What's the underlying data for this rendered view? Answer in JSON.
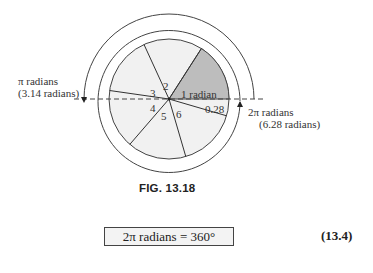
{
  "diagram": {
    "type": "radian-circle",
    "center": [
      169,
      99
    ],
    "radii": {
      "inner": 60,
      "middle": 71,
      "outer": 85
    },
    "colors": {
      "sector_fill": "#f1f1f1",
      "highlight_fill": "#bdbdbd",
      "line": "#444444"
    },
    "segment_labels": [
      "1 radian",
      "2",
      "3",
      "4",
      "5",
      "6",
      "0.28"
    ],
    "left_annotation": {
      "line1": "π radians",
      "line2": "(3.14 radians)"
    },
    "right_annotation": {
      "line1": "2π radians",
      "line2": "(6.28 radians)"
    }
  },
  "caption": "FIG. 13.18",
  "equation": {
    "text": "2π radians = 360°",
    "number": "(13.4)"
  }
}
